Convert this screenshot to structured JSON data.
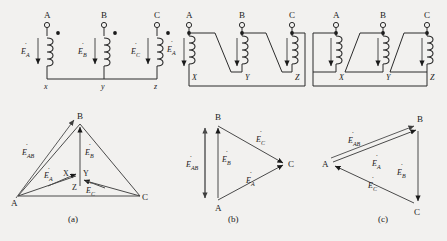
{
  "figure": {
    "background_color": "#f2f1ef",
    "line_color": "#2b2b2b",
    "phasor_color": "#4a4a4a"
  },
  "captions": {
    "a": "(a)",
    "b": "(b)",
    "c": "(c)"
  },
  "symbols": {
    "E_A": "E",
    "E_B": "E",
    "E_C": "E",
    "E_AB": "E",
    "sub_A": "A",
    "sub_B": "B",
    "sub_C": "C",
    "sub_AB": "AB",
    "overdot": "·"
  },
  "panels": [
    {
      "id": "a",
      "caption": "(a)",
      "connection": "wye",
      "circuit": {
        "terminals": [
          {
            "name": "A",
            "label": "A",
            "x": 48,
            "y": 22
          },
          {
            "name": "B",
            "label": "B",
            "x": 105,
            "y": 22
          },
          {
            "name": "C",
            "label": "C",
            "x": 158,
            "y": 22
          }
        ],
        "winding_labels": [
          {
            "label": "E",
            "sub": "A"
          },
          {
            "label": "E",
            "sub": "B"
          },
          {
            "label": "E",
            "sub": "C"
          }
        ],
        "bottom_terminals": [
          "x",
          "y",
          "z"
        ],
        "polarity_dots": 3,
        "neutral_bus": true
      },
      "phasor": {
        "type": "wye",
        "vertices": [
          {
            "label": "A",
            "x": 18,
            "y": 196
          },
          {
            "label": "B",
            "x": 80,
            "y": 124
          },
          {
            "label": "C",
            "x": 140,
            "y": 196
          }
        ],
        "neutral_labels": [
          "X",
          "Y",
          "Z"
        ],
        "phasors": [
          {
            "label": "E",
            "sub": "A"
          },
          {
            "label": "E",
            "sub": "B"
          },
          {
            "label": "E",
            "sub": "C"
          },
          {
            "label": "E",
            "sub": "AB"
          }
        ]
      }
    },
    {
      "id": "b",
      "caption": "(b)",
      "connection": "delta",
      "circuit": {
        "terminals": [
          {
            "name": "A",
            "label": "A",
            "x": 190,
            "y": 22
          },
          {
            "name": "B",
            "label": "B",
            "x": 243,
            "y": 22
          },
          {
            "name": "C",
            "label": "C",
            "x": 293,
            "y": 22
          }
        ],
        "winding_labels": [
          {
            "label": "E",
            "sub": "A"
          }
        ],
        "bottom_terminals": [
          "X",
          "Y",
          "Z"
        ],
        "polarity_dots": 3,
        "neutral_bus": false
      },
      "phasor": {
        "type": "delta",
        "vertices": [
          {
            "label": "B",
            "x": 218,
            "y": 124
          },
          {
            "label": "C",
            "x": 285,
            "y": 163
          },
          {
            "label": "A",
            "x": 218,
            "y": 200
          }
        ],
        "phasors": [
          {
            "label": "E",
            "sub": "AB"
          },
          {
            "label": "E",
            "sub": "B"
          },
          {
            "label": "E",
            "sub": "C"
          },
          {
            "label": "E",
            "sub": "A"
          }
        ]
      }
    },
    {
      "id": "c",
      "caption": "(c)",
      "connection": "reverse-delta",
      "circuit": {
        "terminals": [
          {
            "name": "A",
            "label": "A",
            "x": 337,
            "y": 22
          },
          {
            "name": "B",
            "label": "B",
            "x": 384,
            "y": 22
          },
          {
            "name": "C",
            "label": "C",
            "x": 428,
            "y": 22
          }
        ],
        "winding_labels": [],
        "bottom_terminals": [
          "X",
          "Y",
          "Z"
        ],
        "polarity_dots": 3,
        "neutral_bus": false
      },
      "phasor": {
        "type": "delta",
        "vertices": [
          {
            "label": "B",
            "x": 420,
            "y": 127
          },
          {
            "label": "A",
            "x": 330,
            "y": 163
          },
          {
            "label": "C",
            "x": 416,
            "y": 205
          }
        ],
        "phasors": [
          {
            "label": "E",
            "sub": "AB"
          },
          {
            "label": "E",
            "sub": "A"
          },
          {
            "label": "E",
            "sub": "B"
          },
          {
            "label": "E",
            "sub": "C"
          }
        ]
      }
    }
  ]
}
